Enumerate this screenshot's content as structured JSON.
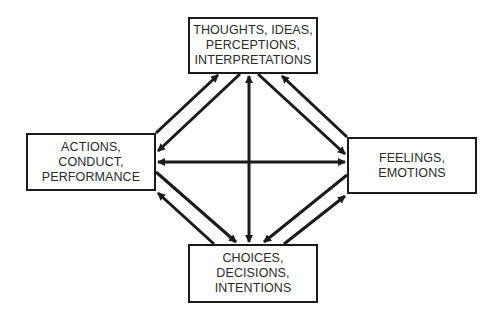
{
  "diagram": {
    "nodes": {
      "top": {
        "lines": [
          "THOUGHTS, IDEAS,",
          "PERCEPTIONS,",
          "INTERPRETATIONS"
        ]
      },
      "left": {
        "lines": [
          "ACTIONS,",
          "CONDUCT,",
          "PERFORMANCE"
        ]
      },
      "right": {
        "lines": [
          "FEELINGS,",
          "EMOTIONS"
        ]
      },
      "bottom": {
        "lines": [
          "CHOICES,",
          "DECISIONS,",
          "INTENTIONS"
        ]
      }
    },
    "edges": [
      {
        "from": "left",
        "to": "top"
      },
      {
        "from": "top",
        "to": "left"
      },
      {
        "from": "top",
        "to": "right"
      },
      {
        "from": "right",
        "to": "top"
      },
      {
        "from": "left",
        "to": "bottom"
      },
      {
        "from": "bottom",
        "to": "left"
      },
      {
        "from": "right",
        "to": "bottom"
      },
      {
        "from": "bottom",
        "to": "right"
      },
      {
        "from": "top",
        "to": "bottom",
        "bidirectional": true
      },
      {
        "from": "left",
        "to": "right",
        "bidirectional": true
      }
    ],
    "colors": {
      "stroke": "#1a1a1a",
      "text": "#2a2a2a",
      "background": "#ffffff"
    }
  }
}
